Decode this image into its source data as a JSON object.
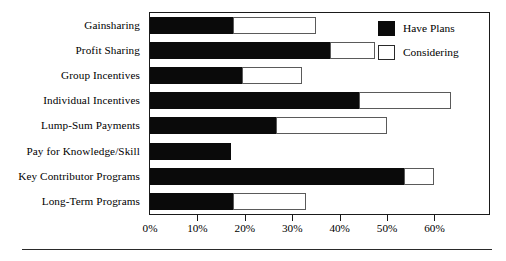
{
  "chart_data": {
    "type": "bar",
    "orientation": "horizontal",
    "stacked": true,
    "title": "",
    "subtitle": "",
    "xlabel": "",
    "ylabel": "",
    "xlim": [
      0,
      71.5
    ],
    "grid": false,
    "legend_position": "top-right",
    "categories": [
      "Gainsharing",
      "Profit Sharing",
      "Group Incentives",
      "Individual Incentives",
      "Lump-Sum Payments",
      "Pay for Knowledge/Skill",
      "Key Contributor Programs",
      "Long-Term Programs"
    ],
    "series": [
      {
        "name": "Have Plans",
        "color": "#0a0a0a",
        "values": [
          17.5,
          38.0,
          19.5,
          44.0,
          26.5,
          17.0,
          53.5,
          17.5
        ]
      },
      {
        "name": "Considering",
        "color": "#ffffff",
        "values": [
          17.5,
          9.5,
          12.5,
          19.5,
          23.5,
          0.0,
          6.5,
          15.5
        ]
      }
    ],
    "totals": [
      35.0,
      47.5,
      32.0,
      63.5,
      50.0,
      17.0,
      60.0,
      33.0
    ],
    "xticks": [
      0,
      10,
      20,
      30,
      40,
      50,
      60
    ],
    "xticklabels": [
      "0%",
      "10%",
      "20%",
      "30%",
      "40%",
      "50%",
      "60%"
    ]
  },
  "legend": {
    "items": [
      {
        "label": "Have Plans",
        "swatch": "black-filled-square"
      },
      {
        "label": "Considering",
        "swatch": "white-outlined-square"
      }
    ]
  },
  "colors": {
    "have_plans": "#0a0a0a",
    "considering": "#ffffff",
    "frame": "#1a1a1a",
    "background": "#ffffff"
  }
}
